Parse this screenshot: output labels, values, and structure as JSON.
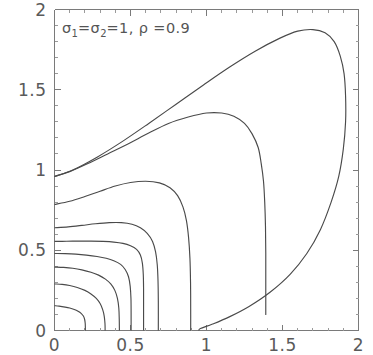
{
  "figure": {
    "background_color": "#ffffff",
    "frame_color": "#7a7a7a",
    "contour_color": "#4a4a4a",
    "width": 373,
    "height": 355
  },
  "annotation": {
    "sigma1_symbol": "σ",
    "sigma1_sub": "1",
    "eq1": "=",
    "sigma2_symbol": "σ",
    "sigma2_sub": "2",
    "eq2": "=",
    "sigma_value": "1",
    "comma": ",",
    "rho_symbol": "ρ",
    "eq3": "=",
    "rho_value": "0.9",
    "full_text": "σ₁=σ₂=1, ρ =0.9"
  },
  "chart_data": {
    "type": "line",
    "subtitle": "",
    "xlabel": "",
    "ylabel": "",
    "xlim": [
      0,
      2
    ],
    "ylim": [
      0,
      2
    ],
    "grid": false,
    "legend": "none",
    "xticks": [
      0,
      0.5,
      1,
      1.5,
      2
    ],
    "xticklabels": [
      "0",
      "0.5",
      "1",
      "1.5",
      "2"
    ],
    "yticks": [
      0,
      0.5,
      1,
      1.5,
      2
    ],
    "yticklabels": [
      "0",
      "0.5",
      "1",
      "1.5",
      "2"
    ],
    "minor_tick_step": 0.1,
    "n_contours": 8,
    "series": [
      {
        "name": "contour-1",
        "level_index": 1,
        "y_intercept_at_x0": 0.155,
        "x_intercept_at_y0": 0.2,
        "points": [
          [
            0.0,
            0.155
          ],
          [
            0.03,
            0.152
          ],
          [
            0.07,
            0.146
          ],
          [
            0.1,
            0.14
          ],
          [
            0.13,
            0.131
          ],
          [
            0.155,
            0.12
          ],
          [
            0.175,
            0.107
          ],
          [
            0.19,
            0.09
          ],
          [
            0.198,
            0.07
          ],
          [
            0.202,
            0.045
          ],
          [
            0.203,
            0.02
          ],
          [
            0.203,
            0.0
          ]
        ]
      },
      {
        "name": "contour-2",
        "level_index": 2,
        "y_intercept_at_x0": 0.29,
        "x_intercept_at_y0": 0.33,
        "points": [
          [
            0.0,
            0.29
          ],
          [
            0.05,
            0.287
          ],
          [
            0.1,
            0.28
          ],
          [
            0.15,
            0.268
          ],
          [
            0.2,
            0.25
          ],
          [
            0.24,
            0.228
          ],
          [
            0.275,
            0.2
          ],
          [
            0.3,
            0.168
          ],
          [
            0.317,
            0.13
          ],
          [
            0.327,
            0.09
          ],
          [
            0.332,
            0.045
          ],
          [
            0.333,
            0.0
          ]
        ]
      },
      {
        "name": "contour-3",
        "level_index": 3,
        "y_intercept_at_x0": 0.395,
        "x_intercept_at_y0": 0.425,
        "points": [
          [
            0.0,
            0.395
          ],
          [
            0.06,
            0.393
          ],
          [
            0.12,
            0.388
          ],
          [
            0.18,
            0.378
          ],
          [
            0.24,
            0.363
          ],
          [
            0.29,
            0.345
          ],
          [
            0.335,
            0.32
          ],
          [
            0.37,
            0.29
          ],
          [
            0.397,
            0.25
          ],
          [
            0.414,
            0.2
          ],
          [
            0.423,
            0.14
          ],
          [
            0.426,
            0.07
          ],
          [
            0.427,
            0.0
          ]
        ]
      },
      {
        "name": "contour-4",
        "level_index": 4,
        "y_intercept_at_x0": 0.48,
        "x_intercept_at_y0": 0.5,
        "points": [
          [
            0.0,
            0.48
          ],
          [
            0.07,
            0.479
          ],
          [
            0.14,
            0.476
          ],
          [
            0.21,
            0.47
          ],
          [
            0.28,
            0.461
          ],
          [
            0.34,
            0.45
          ],
          [
            0.39,
            0.435
          ],
          [
            0.435,
            0.412
          ],
          [
            0.465,
            0.38
          ],
          [
            0.487,
            0.335
          ],
          [
            0.498,
            0.275
          ],
          [
            0.503,
            0.2
          ],
          [
            0.504,
            0.11
          ],
          [
            0.504,
            0.0
          ]
        ]
      },
      {
        "name": "contour-5",
        "level_index": 5,
        "y_intercept_at_x0": 0.555,
        "x_intercept_at_y0": 0.58,
        "points": [
          [
            0.0,
            0.555
          ],
          [
            0.08,
            0.556
          ],
          [
            0.16,
            0.557
          ],
          [
            0.24,
            0.557
          ],
          [
            0.32,
            0.555
          ],
          [
            0.39,
            0.551
          ],
          [
            0.45,
            0.543
          ],
          [
            0.5,
            0.528
          ],
          [
            0.54,
            0.505
          ],
          [
            0.565,
            0.47
          ],
          [
            0.578,
            0.42
          ],
          [
            0.584,
            0.35
          ],
          [
            0.586,
            0.26
          ],
          [
            0.586,
            0.13
          ],
          [
            0.586,
            0.0
          ]
        ]
      },
      {
        "name": "contour-6",
        "level_index": 6,
        "y_intercept_at_x0": 0.64,
        "x_intercept_at_y0": 0.68,
        "points": [
          [
            0.0,
            0.64
          ],
          [
            0.09,
            0.646
          ],
          [
            0.18,
            0.655
          ],
          [
            0.27,
            0.665
          ],
          [
            0.36,
            0.672
          ],
          [
            0.44,
            0.672
          ],
          [
            0.51,
            0.662
          ],
          [
            0.565,
            0.64
          ],
          [
            0.61,
            0.605
          ],
          [
            0.645,
            0.555
          ],
          [
            0.665,
            0.49
          ],
          [
            0.676,
            0.41
          ],
          [
            0.681,
            0.31
          ],
          [
            0.683,
            0.18
          ],
          [
            0.683,
            0.0
          ]
        ]
      },
      {
        "name": "contour-7",
        "level_index": 7,
        "y_intercept_at_x0": 0.785,
        "x_intercept_at_y0": 0.78,
        "points": [
          [
            0.0,
            0.785
          ],
          [
            0.1,
            0.805
          ],
          [
            0.2,
            0.835
          ],
          [
            0.3,
            0.868
          ],
          [
            0.4,
            0.9
          ],
          [
            0.5,
            0.922
          ],
          [
            0.6,
            0.93
          ],
          [
            0.69,
            0.92
          ],
          [
            0.76,
            0.89
          ],
          [
            0.81,
            0.84
          ],
          [
            0.845,
            0.77
          ],
          [
            0.868,
            0.685
          ],
          [
            0.882,
            0.58
          ],
          [
            0.891,
            0.45
          ],
          [
            0.895,
            0.3
          ],
          [
            0.896,
            0.13
          ],
          [
            0.896,
            0.0
          ]
        ]
      },
      {
        "name": "contour-8",
        "level_index": 8,
        "y_intercept_at_x0": 0.96,
        "x_intercept_at_y0": 0.95,
        "points": [
          [
            0.0,
            0.96
          ],
          [
            0.1,
            0.99
          ],
          [
            0.22,
            1.04
          ],
          [
            0.35,
            1.1
          ],
          [
            0.48,
            1.16
          ],
          [
            0.62,
            1.23
          ],
          [
            0.75,
            1.29
          ],
          [
            0.88,
            1.33
          ],
          [
            1.0,
            1.355
          ],
          [
            1.1,
            1.355
          ],
          [
            1.18,
            1.335
          ],
          [
            1.25,
            1.29
          ],
          [
            1.3,
            1.225
          ],
          [
            1.34,
            1.14
          ],
          [
            1.36,
            1.04
          ],
          [
            1.375,
            0.93
          ],
          [
            1.383,
            0.8
          ],
          [
            1.388,
            0.65
          ],
          [
            1.39,
            0.48
          ],
          [
            1.39,
            0.3
          ],
          [
            1.39,
            0.1
          ]
        ]
      },
      {
        "name": "contour-outer",
        "level_index": 9,
        "y_intercept_at_x0": 0.96,
        "x_intercept_at_y0": 0.95,
        "closed": true,
        "peak": [
          1.65,
          1.87
        ],
        "points": [
          [
            0.0,
            0.96
          ],
          [
            0.12,
            1.0
          ],
          [
            0.28,
            1.08
          ],
          [
            0.45,
            1.18
          ],
          [
            0.62,
            1.29
          ],
          [
            0.8,
            1.41
          ],
          [
            0.98,
            1.53
          ],
          [
            1.15,
            1.64
          ],
          [
            1.32,
            1.74
          ],
          [
            1.48,
            1.82
          ],
          [
            1.6,
            1.865
          ],
          [
            1.7,
            1.875
          ],
          [
            1.78,
            1.855
          ],
          [
            1.84,
            1.8
          ],
          [
            1.88,
            1.71
          ],
          [
            1.905,
            1.6
          ],
          [
            1.915,
            1.46
          ],
          [
            1.915,
            1.3
          ],
          [
            1.9,
            1.13
          ],
          [
            1.87,
            0.96
          ],
          [
            1.82,
            0.8
          ],
          [
            1.75,
            0.63
          ],
          [
            1.66,
            0.48
          ],
          [
            1.55,
            0.35
          ],
          [
            1.42,
            0.24
          ],
          [
            1.28,
            0.15
          ],
          [
            1.15,
            0.085
          ],
          [
            1.04,
            0.04
          ],
          [
            0.96,
            0.012
          ],
          [
            0.95,
            0.0
          ]
        ]
      }
    ]
  }
}
